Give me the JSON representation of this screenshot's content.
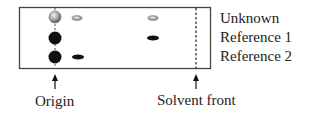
{
  "diagram": {
    "type": "thin-layer-chromatography",
    "lanes": [
      {
        "label": "Unknown",
        "spots": [
          {
            "position": "origin",
            "color": "#9a9a9a",
            "shape": "large-circle"
          },
          {
            "position": "near-origin",
            "color": "#9a9a9a",
            "shape": "small-ellipse"
          },
          {
            "position": "mid",
            "color": "#9a9a9a",
            "shape": "small-ellipse"
          }
        ]
      },
      {
        "label": "Reference 1",
        "spots": [
          {
            "position": "origin",
            "color": "#111111",
            "shape": "large-circle"
          },
          {
            "position": "mid",
            "color": "#111111",
            "shape": "small-ellipse"
          }
        ]
      },
      {
        "label": "Reference 2",
        "spots": [
          {
            "position": "origin",
            "color": "#111111",
            "shape": "large-circle"
          },
          {
            "position": "near-origin",
            "color": "#111111",
            "shape": "small-ellipse"
          }
        ]
      }
    ],
    "markers": {
      "origin": "Origin",
      "solvent_front": "Solvent front"
    }
  }
}
